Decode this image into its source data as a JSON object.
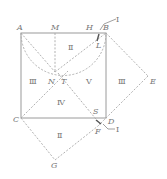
{
  "figure": {
    "type": "geometry-diagram",
    "points": {
      "A": "A",
      "M": "M",
      "H": "H",
      "B": "B",
      "L": "L",
      "N": "N",
      "T": "T",
      "E": "E",
      "C": "C",
      "S": "S",
      "D": "D",
      "F": "F",
      "G": "G"
    },
    "region_labels": {
      "top": "Ⅱ",
      "left": "Ⅲ",
      "center_right": "Ⅴ",
      "right_outer": "Ⅲ",
      "lower": "Ⅳ",
      "bottom": "Ⅱ"
    },
    "callouts": {
      "top_right": "Ⅰ",
      "bottom_right": "Ⅰ"
    },
    "colors": {
      "solid_line": "#9a9a9a",
      "dashed_line": "#a8a8a8",
      "label": "#777777"
    }
  }
}
